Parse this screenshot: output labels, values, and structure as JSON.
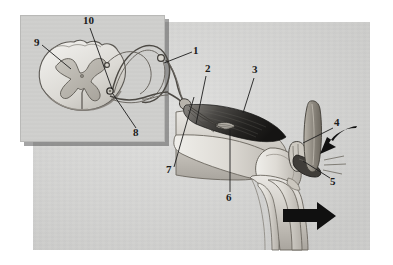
{
  "figure": {
    "background_color": "#ffffff",
    "plate_color": "#d8d8d6",
    "inset_color": "#cfcfcd",
    "ink_color": "#3a3a3a",
    "arrow_color": "#111111"
  },
  "labels": [
    {
      "id": "1",
      "text": "1",
      "x": 196,
      "y": 52,
      "target_x": 163,
      "target_y": 64
    },
    {
      "id": "2",
      "text": "2",
      "x": 208,
      "y": 70,
      "target_x": 196,
      "target_y": 124
    },
    {
      "id": "3",
      "text": "3",
      "x": 255,
      "y": 71,
      "target_x": 242,
      "target_y": 112
    },
    {
      "id": "4",
      "text": "4",
      "x": 337,
      "y": 124,
      "target_x": 306,
      "target_y": 142
    },
    {
      "id": "5",
      "text": "5",
      "x": 333,
      "y": 183,
      "target_x": 305,
      "target_y": 160
    },
    {
      "id": "6",
      "text": "6",
      "x": 228,
      "y": 198,
      "target_x": 230,
      "target_y": 130
    },
    {
      "id": "7",
      "text": "7",
      "x": 168,
      "y": 170,
      "target_x": 193,
      "target_y": 97
    },
    {
      "id": "8",
      "text": "8",
      "x": 136,
      "y": 134,
      "target_x": 113,
      "target_y": 93
    },
    {
      "id": "9",
      "text": "9",
      "x": 36,
      "y": 42,
      "target_x": 70,
      "target_y": 68
    },
    {
      "id": "10",
      "text": "10",
      "x": 86,
      "y": 21,
      "target_x": 112,
      "target_y": 90
    }
  ],
  "parts": {
    "inset_panel": "spinal-cord-cross-section-inset",
    "spinal_cord": "spinal-cord",
    "gray_matter": "gray-matter-butterfly",
    "dorsal_root_ganglion": "dorsal-root-ganglion",
    "sensory_neuron": "sensory-afferent-neuron",
    "motor_neuron": "motor-efferent-neuron",
    "peripheral_nerve": "peripheral-nerve-trunk",
    "quadriceps": "quadriceps-femoris-muscle",
    "muscle_spindle": "muscle-spindle-receptor",
    "femur": "femur-bone",
    "tibia": "tibia-bone",
    "fibula": "fibula-bone",
    "patella": "patella-kneecap",
    "patellar_tendon": "patellar-tendon",
    "reflex_hammer": "reflex-hammer"
  },
  "arrows": [
    {
      "name": "hammer-strike-arrow",
      "direction": "left",
      "x": 318,
      "y": 140
    },
    {
      "name": "leg-kick-arrow",
      "direction": "right",
      "x": 300,
      "y": 215
    }
  ]
}
